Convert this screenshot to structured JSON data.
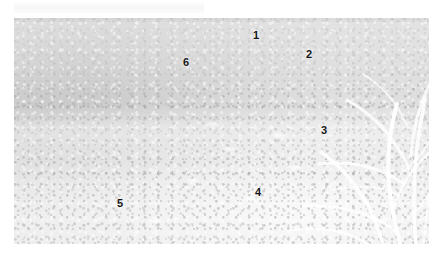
{
  "page": {
    "background_color": "#ffffff",
    "width": 436,
    "height": 260
  },
  "caption": {
    "text": "",
    "visible": true,
    "color": "#f4f4f4"
  },
  "photo": {
    "name": "garden-border-photograph",
    "description": "Faded overexposed colour photograph of a mixed herbaceous garden border with tall flower spikes, white umbel flowers and bright ornamental grass at right",
    "frame": {
      "x": 14,
      "y": 18,
      "width": 415,
      "height": 226
    },
    "tone": "washed-out greyscale",
    "colors": {
      "shadow": "#b9b9b9",
      "midtone": "#cfcfcf",
      "highlight": "#e8e8e8",
      "paper": "#ffffff",
      "label_ink": "#151515"
    }
  },
  "callouts": [
    {
      "id": "callout-1",
      "label": "1",
      "x": 253,
      "y": 30
    },
    {
      "id": "callout-2",
      "label": "2",
      "x": 306,
      "y": 49
    },
    {
      "id": "callout-3",
      "label": "3",
      "x": 321,
      "y": 125
    },
    {
      "id": "callout-4",
      "label": "4",
      "x": 255,
      "y": 187
    },
    {
      "id": "callout-5",
      "label": "5",
      "x": 117,
      "y": 198
    },
    {
      "id": "callout-6",
      "label": "6",
      "x": 183,
      "y": 57
    }
  ]
}
